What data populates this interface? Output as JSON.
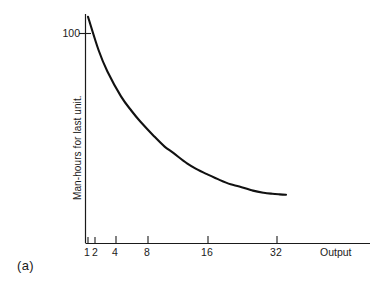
{
  "figure": {
    "panel_label": "(a)",
    "background_color": "#ffffff",
    "ink_color": "#1a1a1a"
  },
  "chart_data": {
    "type": "line",
    "title": "",
    "subtitle": "",
    "xlabel": "Output",
    "ylabel": "Man-hours for last unit.",
    "x_scale": "log2",
    "x_tick_labels": [
      "1",
      "2",
      "4",
      "8",
      "16",
      "32"
    ],
    "x_tick_values": [
      1,
      2,
      4,
      8,
      16,
      32
    ],
    "y_tick_labels": [
      "100"
    ],
    "y_tick_values": [
      100
    ],
    "xlim": [
      1,
      64
    ],
    "ylim": [
      0,
      115
    ],
    "grid": false,
    "legend": false,
    "annotations": [],
    "series": [
      {
        "name": "Man-hours per unit",
        "x": [
          1,
          1.25,
          1.5,
          2,
          2.5,
          3,
          4,
          5,
          6,
          8,
          10,
          12,
          16,
          20,
          24,
          32,
          40,
          48,
          56,
          64
        ],
        "values": [
          108,
          92,
          82,
          70,
          63,
          58,
          51,
          46,
          43,
          38,
          35,
          33,
          30,
          28,
          27,
          25,
          24,
          23.5,
          23.2,
          23
        ]
      }
    ]
  }
}
